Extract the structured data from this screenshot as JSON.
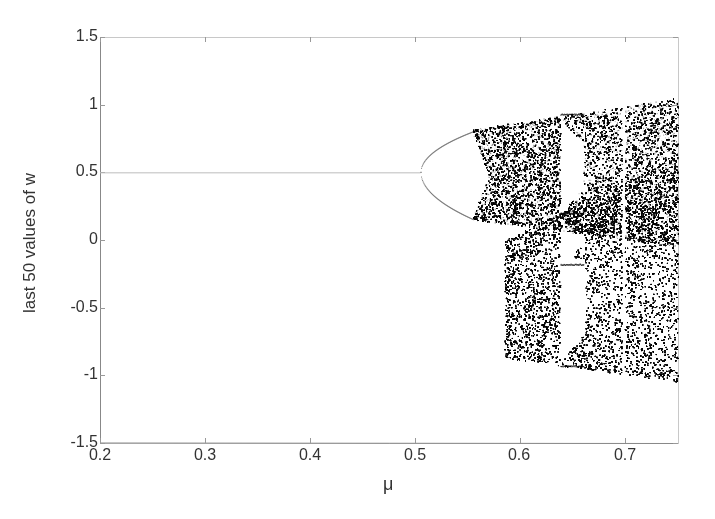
{
  "chart_data": {
    "type": "scatter",
    "title": "",
    "xlabel": "μ",
    "ylabel": "last 50 values of w",
    "xlim": [
      0.2,
      0.75
    ],
    "ylim": [
      -1.5,
      1.5
    ],
    "xticks": [
      0.2,
      0.3,
      0.4,
      0.5,
      0.6,
      0.7
    ],
    "xtick_labels": [
      "0.2",
      "0.3",
      "0.4",
      "0.5",
      "0.6",
      "0.7"
    ],
    "yticks": [
      1.5,
      1,
      0.5,
      0,
      -0.5,
      -1,
      -1.5
    ],
    "ytick_labels": [
      "1.5",
      "1",
      "0.5",
      "0",
      "-0.5",
      "-1",
      "-1.5"
    ],
    "grid": false,
    "legend": null,
    "regions": [
      {
        "name": "fixed_point",
        "mu_range": [
          0.2,
          0.505
        ],
        "w": 0.5
      },
      {
        "name": "period_2_loop",
        "mu_range": [
          0.505,
          0.555
        ],
        "upper_w": [
          0.5,
          0.8
        ],
        "lower_w": [
          0.5,
          0.15
        ]
      },
      {
        "name": "upper_chaotic_band",
        "mu_range": [
          0.555,
          0.75
        ],
        "upper_bound": [
          0.82,
          1.05
        ],
        "lower_bound": [
          0.15,
          -0.05
        ]
      },
      {
        "name": "lower_chaotic_band",
        "mu_range": [
          0.585,
          0.75
        ],
        "upper_bound": [
          0.0,
          0.62
        ],
        "lower_bound": [
          -0.87,
          -1.05
        ]
      },
      {
        "name": "periodic_window",
        "mu_range": [
          0.638,
          0.66
        ],
        "branches": [
          0.93,
          0.2,
          -0.18,
          -0.93
        ]
      },
      {
        "name": "narrow_window",
        "mu_range": [
          0.697,
          0.7
        ]
      }
    ],
    "point_color": "#000000"
  }
}
